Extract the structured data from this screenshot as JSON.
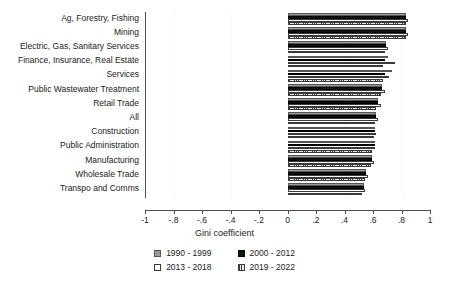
{
  "chart_data": {
    "type": "bar",
    "orientation": "horizontal",
    "title": "",
    "subtitle": "",
    "xlabel": "Gini coefficient",
    "ylabel": "",
    "xlim": [
      -1,
      1
    ],
    "xticks": [
      -1,
      -0.8,
      -0.6,
      -0.4,
      -0.2,
      0,
      0.2,
      0.4,
      0.6,
      0.8,
      1
    ],
    "xtick_labels": [
      "-1",
      "-.8",
      "-.6",
      "-.4",
      "-.2",
      "0",
      ".2",
      ".4",
      ".6",
      ".8",
      "1"
    ],
    "grid": false,
    "legend_position": "bottom",
    "categories": [
      "Ag, Forestry, Fishing",
      "Mining",
      "Electric, Gas, Sanitary Services",
      "Finance, Insurance, Real Estate",
      "Services",
      "Public Wastewater Treatment",
      "Retail Trade",
      "All",
      "Construction",
      "Public Administration",
      "Manufacturing",
      "Wholesale Trade",
      "Transpo and Comms"
    ],
    "series": [
      {
        "name": "1990 - 1999",
        "color": "#9a9a9a",
        "pattern": "solid-gray",
        "values": [
          0.83,
          0.83,
          0.69,
          0.7,
          0.73,
          0.66,
          0.63,
          0.62,
          0.61,
          0.61,
          0.59,
          0.55,
          0.53
        ]
      },
      {
        "name": "2000 - 2012",
        "color": "#111111",
        "pattern": "solid-black",
        "values": [
          0.83,
          0.83,
          0.69,
          0.68,
          0.68,
          0.66,
          0.63,
          0.62,
          0.61,
          0.61,
          0.59,
          0.55,
          0.53
        ]
      },
      {
        "name": "2013 - 2018",
        "color": "#ffffff",
        "pattern": "hollow-white",
        "values": [
          0.84,
          0.84,
          0.7,
          0.75,
          0.71,
          0.68,
          0.65,
          0.63,
          0.62,
          0.61,
          0.6,
          0.56,
          0.54
        ]
      },
      {
        "name": "2019 - 2022",
        "color": "#3f3f3f",
        "pattern": "vertical-hatch",
        "values": [
          0.83,
          0.83,
          0.68,
          0.67,
          0.67,
          0.65,
          0.62,
          0.61,
          0.6,
          0.59,
          0.58,
          0.54,
          0.52
        ]
      }
    ]
  }
}
